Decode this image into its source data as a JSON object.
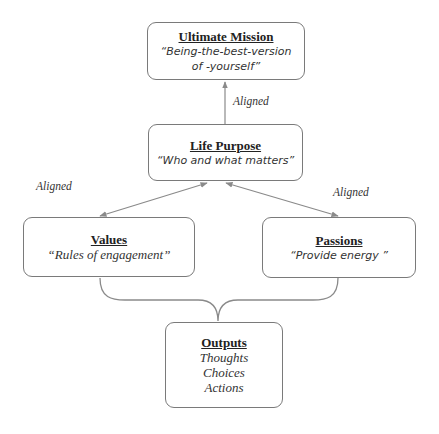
{
  "nodes": {
    "ultimate_mission": {
      "title": "Ultimate Mission",
      "lines": [
        "“Being-the-best-version",
        "of -yourself”"
      ]
    },
    "life_purpose": {
      "title": "Life Purpose",
      "lines": [
        "“Who and what matters”"
      ]
    },
    "values": {
      "title": "Values",
      "lines": [
        "“Rules of engagement”"
      ]
    },
    "passions": {
      "title": "Passions",
      "lines": [
        "“Provide energy ”"
      ]
    },
    "outputs": {
      "title": "Outputs",
      "lines": [
        "Thoughts",
        "Choices",
        "Actions"
      ]
    }
  },
  "edge_labels": {
    "purpose_to_mission": "Aligned",
    "purpose_to_values": "Aligned",
    "purpose_to_passions": "Aligned"
  },
  "colors": {
    "line": "#8a8a8a",
    "border": "#7a7a7a",
    "text": "#2a2a2a"
  }
}
